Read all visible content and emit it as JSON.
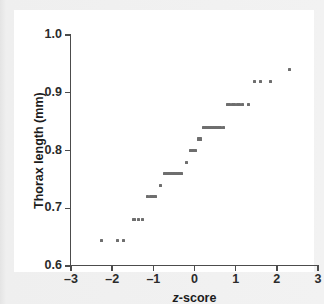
{
  "chart_data": {
    "type": "scatter",
    "title": "",
    "xlabel": "z-score",
    "ylabel": "Thorax length (mm)",
    "xlim": [
      -3,
      3
    ],
    "ylim": [
      0.6,
      1.0
    ],
    "xticks": [
      -3,
      -2,
      -1,
      0,
      1,
      2,
      3
    ],
    "yticks": [
      0.6,
      0.7,
      0.8,
      0.9,
      1.0
    ],
    "xticklabels": [
      "–3",
      "–2",
      "–1",
      "0",
      "1",
      "2",
      "3"
    ],
    "yticklabels": [
      "0.6",
      "0.7",
      "0.8",
      "0.9",
      "1.0"
    ],
    "grid": false,
    "legend": null,
    "marker": "square",
    "marker_color": "#6e6e6e",
    "marker_size": 3,
    "series": [
      {
        "name": "thorax length quantiles",
        "x": [
          -2.25,
          -1.88,
          -1.72,
          -1.47,
          -1.36,
          -1.26,
          -1.15,
          -1.08,
          -1.02,
          -0.96,
          -0.82,
          -0.72,
          -0.68,
          -0.64,
          -0.6,
          -0.56,
          -0.52,
          -0.48,
          -0.44,
          -0.4,
          -0.36,
          -0.32,
          -0.2,
          -0.1,
          -0.06,
          -0.02,
          0.02,
          0.1,
          0.14,
          0.22,
          0.26,
          0.3,
          0.34,
          0.38,
          0.42,
          0.46,
          0.5,
          0.54,
          0.58,
          0.62,
          0.7,
          0.8,
          0.86,
          0.92,
          0.98,
          1.04,
          1.1,
          1.16,
          1.3,
          1.46,
          1.61,
          1.85,
          2.31
        ],
        "y": [
          0.645,
          0.645,
          0.645,
          0.68,
          0.68,
          0.68,
          0.72,
          0.72,
          0.72,
          0.72,
          0.74,
          0.76,
          0.76,
          0.76,
          0.76,
          0.76,
          0.76,
          0.76,
          0.76,
          0.76,
          0.76,
          0.76,
          0.78,
          0.8,
          0.8,
          0.8,
          0.8,
          0.82,
          0.82,
          0.84,
          0.84,
          0.84,
          0.84,
          0.84,
          0.84,
          0.84,
          0.84,
          0.84,
          0.84,
          0.84,
          0.84,
          0.88,
          0.88,
          0.88,
          0.88,
          0.88,
          0.88,
          0.88,
          0.88,
          0.92,
          0.92,
          0.92,
          0.94
        ]
      }
    ]
  },
  "axes": {
    "xlabel_prefix": "z",
    "xlabel_suffix": "-score",
    "ylabel_text": "Thorax length (mm)"
  }
}
